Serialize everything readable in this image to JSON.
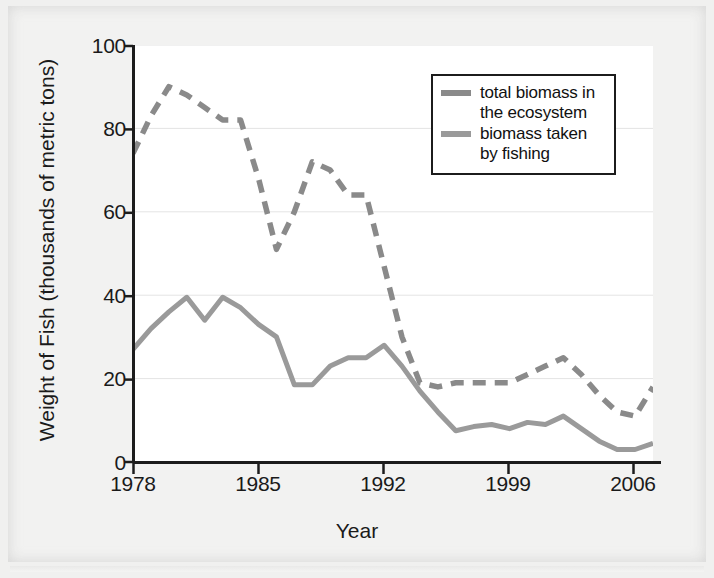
{
  "chart_data": {
    "type": "line",
    "title": "",
    "xlabel": "Year",
    "ylabel": "Weight of Fish (thousands of metric tons)",
    "xlim": [
      1978,
      2007
    ],
    "ylim": [
      0,
      100
    ],
    "grid": true,
    "grid_axis": "y",
    "legend_position": "top-right",
    "xticks": [
      "1978",
      "1985",
      "1992",
      "1999",
      "2006"
    ],
    "xtick_values": [
      1978,
      1985,
      1992,
      1999,
      2006
    ],
    "yticks": [
      "0",
      "20",
      "40",
      "60",
      "80",
      "100"
    ],
    "ytick_values": [
      0,
      20,
      40,
      60,
      80,
      100
    ],
    "x": [
      1978,
      1979,
      1980,
      1981,
      1982,
      1983,
      1984,
      1985,
      1986,
      1987,
      1988,
      1989,
      1990,
      1991,
      1992,
      1993,
      1994,
      1995,
      1996,
      1997,
      1998,
      1999,
      2000,
      2001,
      2002,
      2003,
      2004,
      2005,
      2006,
      2007
    ],
    "series": [
      {
        "name": "total biomass in the ecosystem",
        "style": "dashed",
        "color": "#8a8a8a",
        "values": [
          74,
          83,
          90,
          88,
          85,
          82,
          82,
          68,
          51,
          60,
          72,
          70,
          64,
          64,
          47,
          30,
          19,
          18,
          19,
          19,
          19,
          19,
          21,
          23,
          25,
          21,
          16,
          12,
          11,
          18
        ]
      },
      {
        "name": "biomass taken by fishing",
        "style": "solid",
        "color": "#9a9a9a",
        "values": [
          27,
          32,
          36,
          39.5,
          34,
          39.5,
          37,
          33,
          30,
          18.5,
          18.5,
          23,
          25,
          25,
          28,
          23,
          17,
          12,
          7.5,
          8.5,
          9,
          8,
          9.5,
          9,
          11,
          8,
          5,
          3,
          3,
          4.5
        ]
      }
    ]
  },
  "legend": {
    "entries": [
      {
        "label_line1": "total biomass in",
        "label_line2": "the ecosystem",
        "color": "#8a8a8a",
        "style": "dashed"
      },
      {
        "label_line1": "biomass taken",
        "label_line2": "by fishing",
        "color": "#9a9a9a",
        "style": "solid"
      }
    ]
  },
  "axis": {
    "x_title": "Year",
    "y_title": "Weight of Fish (thousands of metric tons)",
    "x_tick_0": "1978",
    "x_tick_1": "1985",
    "x_tick_2": "1992",
    "x_tick_3": "1999",
    "x_tick_4": "2006",
    "y_tick_0": "0",
    "y_tick_1": "20",
    "y_tick_2": "40",
    "y_tick_3": "60",
    "y_tick_4": "80",
    "y_tick_5": "100"
  },
  "colors": {
    "page_background": "#f2f2f1",
    "plot_background": "#ffffff",
    "axis": "#1c1c1c",
    "grid": "#e4e4e4",
    "series_dashed": "#8a8a8a",
    "series_solid": "#9a9a9a",
    "text": "#1a1a1a"
  }
}
